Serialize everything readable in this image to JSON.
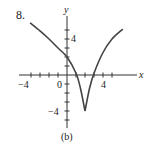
{
  "problem_number": "8.",
  "caption": "(b)",
  "axes": {
    "x_label": "x",
    "y_label": "y",
    "x_tick_labels": [
      "−4",
      "0",
      "4"
    ],
    "y_tick_labels": [
      "4",
      "−4"
    ]
  },
  "chart_data": {
    "type": "line",
    "title": "8.",
    "subtitle": "(b)",
    "xlabel": "x",
    "ylabel": "y",
    "xlim": [
      -5,
      7
    ],
    "ylim": [
      -5.5,
      6
    ],
    "x_ticks": [
      -4,
      -3,
      -2,
      -1,
      0,
      1,
      2,
      3,
      4,
      5
    ],
    "y_ticks": [
      -5,
      -4,
      -3,
      -2,
      -1,
      0,
      1,
      2,
      3,
      4,
      5
    ],
    "x_tick_labels": {
      "-4": "−4",
      "0": "0",
      "4": "4"
    },
    "y_tick_labels": {
      "4": "4",
      "-4": "−4"
    },
    "grid": false,
    "series": [
      {
        "name": "curve",
        "x": [
          -4.1,
          -3,
          -2,
          -1,
          0,
          1,
          1.5,
          2,
          2.5,
          3,
          4,
          5,
          6.2
        ],
        "y": [
          5.8,
          4.9,
          4.0,
          3.0,
          2.0,
          0.2,
          -1.5,
          -4.0,
          -1.5,
          0.2,
          2.5,
          4.0,
          5.1
        ]
      }
    ],
    "annotations": [
      {
        "type": "cusp",
        "x": 2,
        "y": -4
      },
      {
        "type": "x-intercept",
        "x": 1
      },
      {
        "type": "x-intercept",
        "x": 3
      },
      {
        "type": "y-intercept",
        "y": 2
      }
    ]
  }
}
